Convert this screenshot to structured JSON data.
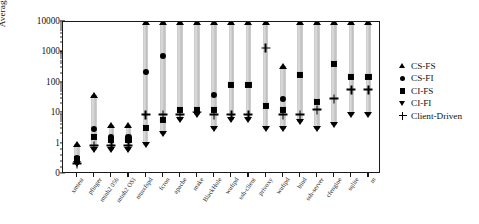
{
  "chart_data": {
    "type": "scatter",
    "title": "",
    "xlabel": "",
    "ylabel": "Average time (s)",
    "yscale": "log",
    "ylim": [
      0,
      10000
    ],
    "ytick_labels": [
      "0",
      "1",
      "10",
      "100",
      "1000",
      "10000"
    ],
    "ytick_values": [
      0,
      1,
      10,
      100,
      1000,
      10000
    ],
    "grid": false,
    "legend_position": "right",
    "capped_marker_note": "Markers drawn at the 10000 top edge are runs that exceeded the time limit",
    "categories": [
      "xmtest",
      "pfinger",
      "mtnh2 056",
      "mtnh2 OSI",
      "mtnxfspd",
      "fcron",
      "apache",
      "make",
      "BlackHole",
      "wuftpd",
      "ssh-client",
      "privoxy",
      "wuftpd",
      "bind",
      "ssh-server",
      "cfengine",
      "sqlite",
      "m"
    ],
    "series": [
      {
        "name": "CS-FS",
        "marker": "triangle-up",
        "values": [
          1.0,
          40,
          4.0,
          4.0,
          10000,
          10000,
          10000,
          10000,
          10000,
          10000,
          10000,
          10000,
          350,
          10000,
          10000,
          10000,
          10000,
          10000
        ]
      },
      {
        "name": "CS-FI",
        "marker": "circle",
        "values": [
          0.32,
          3.0,
          1.6,
          1.6,
          230,
          760,
          10000,
          10000,
          40,
          10000,
          10000,
          10000,
          30,
          10000,
          10000,
          10000,
          10000,
          10000
        ]
      },
      {
        "name": "CI-FS",
        "marker": "square",
        "values": [
          0.3,
          1.6,
          1.5,
          1.4,
          3.2,
          6.0,
          13,
          13,
          13,
          85,
          85,
          17,
          13,
          180,
          23,
          420,
          160,
          160
        ]
      },
      {
        "name": "CI-FI",
        "marker": "triangle-down",
        "values": [
          0.22,
          0.6,
          0.6,
          0.6,
          0.9,
          2.0,
          6.0,
          9.0,
          6.0,
          6.0,
          6.0,
          3.0,
          3.0,
          5.0,
          3.0,
          4.0,
          9.0,
          9.0
        ]
      },
      {
        "name": "Client-Driven",
        "marker": "plus",
        "values": [
          0.22,
          0.85,
          0.85,
          0.85,
          1.5,
          9.0,
          9.0,
          9.0,
          9.0,
          9.0,
          9.0,
          1400,
          9.0,
          9.0,
          3.5,
          30,
          60,
          60
        ]
      }
    ],
    "columns": [
      {
        "label": "xmtest",
        "top": 1.0,
        "bottom": 0.22,
        "markers": [
          {
            "s": "triangle-up",
            "v": 1.0
          },
          {
            "s": "circle",
            "v": 0.33
          },
          {
            "s": "square",
            "v": 0.3
          },
          {
            "s": "plus",
            "v": 0.22
          },
          {
            "s": "triangle-down",
            "v": 0.22
          }
        ]
      },
      {
        "label": "pfinger",
        "top": 40,
        "bottom": 0.6,
        "markers": [
          {
            "s": "triangle-up",
            "v": 40
          },
          {
            "s": "circle",
            "v": 3.0
          },
          {
            "s": "square",
            "v": 1.6
          },
          {
            "s": "plus",
            "v": 0.85
          },
          {
            "s": "triangle-down",
            "v": 0.6
          }
        ]
      },
      {
        "label": "mtnh2 056",
        "top": 4.2,
        "bottom": 0.6,
        "markers": [
          {
            "s": "triangle-up",
            "v": 4.2
          },
          {
            "s": "circle",
            "v": 1.7
          },
          {
            "s": "square",
            "v": 1.35
          },
          {
            "s": "plus",
            "v": 0.85
          },
          {
            "s": "triangle-down",
            "v": 0.6
          }
        ]
      },
      {
        "label": "mtnh2 OSI",
        "top": 4.2,
        "bottom": 0.6,
        "markers": [
          {
            "s": "triangle-up",
            "v": 4.2
          },
          {
            "s": "circle",
            "v": 1.7
          },
          {
            "s": "square",
            "v": 1.35
          },
          {
            "s": "plus",
            "v": 0.85
          },
          {
            "s": "triangle-down",
            "v": 0.6
          }
        ]
      },
      {
        "label": "mtnxfspd",
        "top": 10000,
        "bottom": 0.9,
        "markers": [
          {
            "s": "triangle-up",
            "v": 10000
          },
          {
            "s": "circle",
            "v": 230
          },
          {
            "s": "square",
            "v": 3.2
          },
          {
            "s": "plus",
            "v": 9.0
          },
          {
            "s": "triangle-down",
            "v": 0.9
          }
        ]
      },
      {
        "label": "fcron",
        "top": 10000,
        "bottom": 2.0,
        "markers": [
          {
            "s": "triangle-up",
            "v": 10000
          },
          {
            "s": "circle",
            "v": 760
          },
          {
            "s": "square",
            "v": 6.0
          },
          {
            "s": "plus",
            "v": 9.0
          },
          {
            "s": "triangle-down",
            "v": 2.0
          }
        ]
      },
      {
        "label": "apache",
        "top": 10000,
        "bottom": 6.0,
        "markers": [
          {
            "s": "triangle-up",
            "v": 10000
          },
          {
            "s": "square",
            "v": 13
          },
          {
            "s": "plus",
            "v": 9.0
          },
          {
            "s": "triangle-down",
            "v": 6.0
          }
        ]
      },
      {
        "label": "make",
        "top": 10000,
        "bottom": 9.0,
        "markers": [
          {
            "s": "triangle-up",
            "v": 10000
          },
          {
            "s": "square",
            "v": 13
          },
          {
            "s": "plus",
            "v": 11
          },
          {
            "s": "triangle-down",
            "v": 9.0
          }
        ]
      },
      {
        "label": "BlackHole",
        "top": 10000,
        "bottom": 3.0,
        "markers": [
          {
            "s": "triangle-up",
            "v": 10000
          },
          {
            "s": "circle",
            "v": 40
          },
          {
            "s": "square",
            "v": 13
          },
          {
            "s": "plus",
            "v": 9.0
          },
          {
            "s": "triangle-down",
            "v": 3.0
          }
        ]
      },
      {
        "label": "wuftpd",
        "top": 10000,
        "bottom": 6.0,
        "markers": [
          {
            "s": "triangle-up",
            "v": 10000
          },
          {
            "s": "square",
            "v": 85
          },
          {
            "s": "plus",
            "v": 9.0
          },
          {
            "s": "triangle-down",
            "v": 6.0
          }
        ]
      },
      {
        "label": "ssh-client",
        "top": 10000,
        "bottom": 6.0,
        "markers": [
          {
            "s": "triangle-up",
            "v": 10000
          },
          {
            "s": "square",
            "v": 85
          },
          {
            "s": "plus",
            "v": 9.0
          },
          {
            "s": "triangle-down",
            "v": 6.0
          }
        ]
      },
      {
        "label": "privoxy",
        "top": 10000,
        "bottom": 3.0,
        "markers": [
          {
            "s": "triangle-up",
            "v": 10000
          },
          {
            "s": "plus",
            "v": 1400
          },
          {
            "s": "square",
            "v": 17
          },
          {
            "s": "triangle-down",
            "v": 3.0
          }
        ]
      },
      {
        "label": "wuftpd",
        "top": 350,
        "bottom": 3.0,
        "markers": [
          {
            "s": "triangle-up",
            "v": 350
          },
          {
            "s": "circle",
            "v": 30
          },
          {
            "s": "square",
            "v": 13
          },
          {
            "s": "plus",
            "v": 9.0
          },
          {
            "s": "triangle-down",
            "v": 3.0
          }
        ]
      },
      {
        "label": "bind",
        "top": 10000,
        "bottom": 5.0,
        "markers": [
          {
            "s": "triangle-up",
            "v": 10000
          },
          {
            "s": "square",
            "v": 180
          },
          {
            "s": "plus",
            "v": 9.0
          },
          {
            "s": "triangle-down",
            "v": 5.0
          }
        ]
      },
      {
        "label": "ssh-server",
        "top": 10000,
        "bottom": 3.0,
        "markers": [
          {
            "s": "triangle-up",
            "v": 10000
          },
          {
            "s": "square",
            "v": 23
          },
          {
            "s": "plus",
            "v": 13
          },
          {
            "s": "triangle-down",
            "v": 3.0
          }
        ]
      },
      {
        "label": "cfengine",
        "top": 10000,
        "bottom": 4.0,
        "markers": [
          {
            "s": "triangle-up",
            "v": 10000
          },
          {
            "s": "square",
            "v": 420
          },
          {
            "s": "plus",
            "v": 30
          },
          {
            "s": "triangle-down",
            "v": 4.0
          }
        ]
      },
      {
        "label": "sqlite",
        "top": 10000,
        "bottom": 9.0,
        "markers": [
          {
            "s": "triangle-up",
            "v": 10000
          },
          {
            "s": "square",
            "v": 160
          },
          {
            "s": "plus",
            "v": 60
          },
          {
            "s": "triangle-down",
            "v": 9.0
          }
        ]
      },
      {
        "label": "m",
        "top": 10000,
        "bottom": 9.0,
        "markers": [
          {
            "s": "triangle-up",
            "v": 10000
          },
          {
            "s": "square",
            "v": 160
          },
          {
            "s": "plus",
            "v": 60
          },
          {
            "s": "triangle-down",
            "v": 9.0
          }
        ]
      }
    ]
  },
  "axis": {
    "y_title": "Average time (s)",
    "y_ticks": [
      "10000",
      "1000",
      "100",
      "10",
      "1",
      "0"
    ]
  },
  "legend": {
    "items": [
      {
        "label": "CS-FS",
        "symbol": "triangle-up-icon"
      },
      {
        "label": "CS-FI",
        "symbol": "circle-icon"
      },
      {
        "label": "CI-FS",
        "symbol": "square-icon"
      },
      {
        "label": "CI-FI",
        "symbol": "triangle-down-icon"
      },
      {
        "label": "Client-Driven",
        "symbol": "plus-icon"
      }
    ]
  }
}
